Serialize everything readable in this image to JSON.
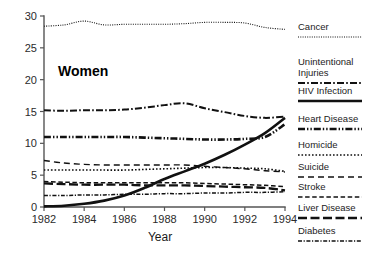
{
  "figure": {
    "panel_label": "Women",
    "xlabel": "Year",
    "ylabel": ""
  },
  "axes": {
    "y_ticks": [
      "0",
      "5",
      "10",
      "15",
      "20",
      "25",
      "30"
    ],
    "x_ticks": [
      "1982",
      "1984",
      "1986",
      "1988",
      "1990",
      "1992",
      "1994"
    ]
  },
  "legend": {
    "entries": [
      {
        "label": "Cancer",
        "style": "fine-dotted"
      },
      {
        "label": "Unintentional Injuries",
        "label_line1": "Unintentional",
        "label_line2": "Injuries",
        "style": "dash-dot"
      },
      {
        "label": "HIV Infection",
        "style": "solid-bold"
      },
      {
        "label": "Heart Disease",
        "style": "dash-dot-dot-bold"
      },
      {
        "label": "Homicide",
        "style": "dotted"
      },
      {
        "label": "Suicide",
        "style": "long-dash"
      },
      {
        "label": "Stroke",
        "style": "dash"
      },
      {
        "label": "Liver Disease",
        "style": "solid-thick-short"
      },
      {
        "label": "Diabetes",
        "style": "dash-dot-fine"
      }
    ]
  },
  "colors": {
    "ink": "#111111",
    "axis": "#555555",
    "background": "#ffffff"
  },
  "chart_data": {
    "type": "line",
    "title": "Women",
    "xlabel": "Year",
    "ylabel": "",
    "xlim": [
      1982,
      1994
    ],
    "ylim": [
      0,
      30
    ],
    "grid": false,
    "legend_position": "right",
    "x": [
      1982,
      1983,
      1984,
      1985,
      1986,
      1987,
      1988,
      1989,
      1990,
      1991,
      1992,
      1993,
      1994
    ],
    "series": [
      {
        "name": "Cancer",
        "style": "fine-dotted",
        "values": [
          28.4,
          28.6,
          29.2,
          28.6,
          28.7,
          28.7,
          28.7,
          28.8,
          29.0,
          29.0,
          28.9,
          28.2,
          27.9
        ]
      },
      {
        "name": "Unintentional Injuries",
        "style": "dash-dot",
        "values": [
          15.2,
          15.1,
          15.2,
          15.2,
          15.3,
          15.6,
          16.0,
          16.3,
          15.5,
          14.9,
          14.3,
          14.0,
          14.2
        ]
      },
      {
        "name": "HIV Infection",
        "style": "solid-bold",
        "values": [
          0.1,
          0.2,
          0.5,
          1.0,
          1.8,
          3.0,
          4.4,
          5.6,
          6.8,
          8.2,
          9.8,
          11.6,
          14.0
        ]
      },
      {
        "name": "Heart Disease",
        "style": "dash-dot-dot-bold",
        "values": [
          11.0,
          11.0,
          11.0,
          11.0,
          11.0,
          10.9,
          10.8,
          10.7,
          10.6,
          10.6,
          10.7,
          11.0,
          13.0
        ]
      },
      {
        "name": "Homicide",
        "style": "dotted",
        "values": [
          5.8,
          5.8,
          5.8,
          5.8,
          5.8,
          5.9,
          6.0,
          6.1,
          6.2,
          6.2,
          6.1,
          6.0,
          5.6
        ]
      },
      {
        "name": "Suicide",
        "style": "long-dash",
        "values": [
          7.3,
          6.9,
          6.7,
          6.6,
          6.6,
          6.6,
          6.6,
          6.6,
          6.4,
          6.2,
          6.0,
          5.7,
          5.5
        ]
      },
      {
        "name": "Stroke",
        "style": "dash",
        "values": [
          4.0,
          3.9,
          3.8,
          3.8,
          3.8,
          3.8,
          3.8,
          3.8,
          3.7,
          3.6,
          3.5,
          3.4,
          3.2
        ]
      },
      {
        "name": "Liver Disease",
        "style": "solid-thick-short",
        "values": [
          3.7,
          3.6,
          3.5,
          3.5,
          3.5,
          3.4,
          3.4,
          3.4,
          3.3,
          3.2,
          3.1,
          3.0,
          2.6
        ]
      },
      {
        "name": "Diabetes",
        "style": "dash-dot-fine",
        "values": [
          1.8,
          1.8,
          1.9,
          1.9,
          2.0,
          2.0,
          2.1,
          2.1,
          2.2,
          2.2,
          2.3,
          2.3,
          2.4
        ]
      }
    ]
  }
}
